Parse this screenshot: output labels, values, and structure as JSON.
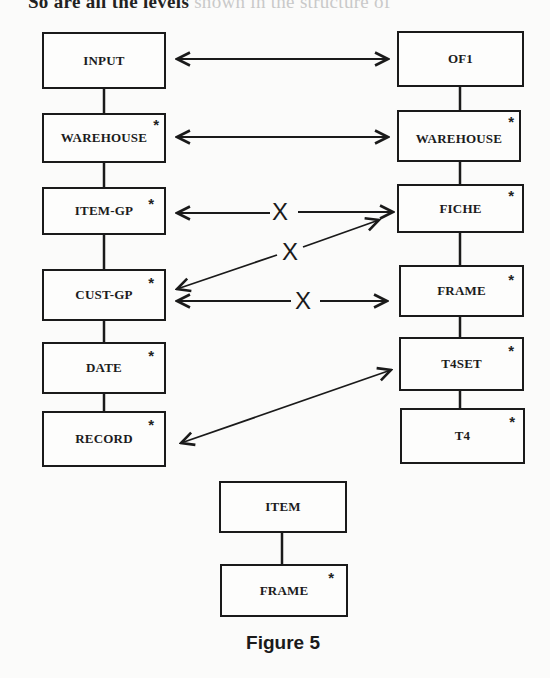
{
  "page": {
    "top_text_visible": "So are all the levels",
    "top_text_faint": " shown in the structure of"
  },
  "figure": {
    "caption": "Figure 5",
    "left_column": [
      {
        "label": "INPUT",
        "star": ""
      },
      {
        "label": "WAREHOUSE",
        "star": "*"
      },
      {
        "label": "ITEM-GP",
        "star": "*"
      },
      {
        "label": "CUST-GP",
        "star": "*"
      },
      {
        "label": "DATE",
        "star": "*"
      },
      {
        "label": "RECORD",
        "star": "*"
      }
    ],
    "right_column": [
      {
        "label": "OF1",
        "star": ""
      },
      {
        "label": "WAREHOUSE",
        "star": "*"
      },
      {
        "label": "FICHE",
        "star": "*"
      },
      {
        "label": "FRAME",
        "star": "*"
      },
      {
        "label": "T4SET",
        "star": "*"
      },
      {
        "label": "T4",
        "star": "*"
      }
    ],
    "bottom_column": [
      {
        "label": "ITEM",
        "star": ""
      },
      {
        "label": "FRAME",
        "star": "*"
      }
    ],
    "correspondences": [
      {
        "from": "INPUT",
        "to": "OF1",
        "type": "bidirectional",
        "valid": true
      },
      {
        "from": "WAREHOUSE",
        "to": "WAREHOUSE",
        "type": "bidirectional",
        "valid": true
      },
      {
        "from": "ITEM-GP",
        "to": "FICHE",
        "type": "bidirectional",
        "valid": false,
        "mark": "X"
      },
      {
        "from": "CUST-GP",
        "to": "FICHE",
        "type": "bidirectional",
        "valid": false,
        "mark": "X"
      },
      {
        "from": "CUST-GP",
        "to": "FRAME",
        "type": "bidirectional",
        "valid": false,
        "mark": "X"
      },
      {
        "from": "RECORD",
        "to": "T4SET",
        "type": "bidirectional",
        "valid": true
      }
    ],
    "cross_mark": "X"
  }
}
